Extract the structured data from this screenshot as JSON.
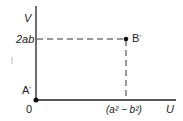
{
  "diagram": {
    "type": "coordinate-mapping",
    "axes": {
      "vertical_label": "V",
      "horizontal_label": "U",
      "origin_label": "0"
    },
    "points": [
      {
        "name": "A",
        "prime": "'",
        "u": 0,
        "v": 0,
        "label": "A'"
      },
      {
        "name": "B",
        "prime": "'",
        "u": "(a² − b²)",
        "v": "2ab",
        "label": "B'"
      }
    ],
    "ticks": {
      "v_tick": "2ab",
      "u_tick_a": "a",
      "u_tick_b": "b",
      "u_tick_exp": "2",
      "u_tick_text": "(a² − b²)"
    },
    "colors": {
      "line": "#222222",
      "background": "#ffffff"
    }
  }
}
